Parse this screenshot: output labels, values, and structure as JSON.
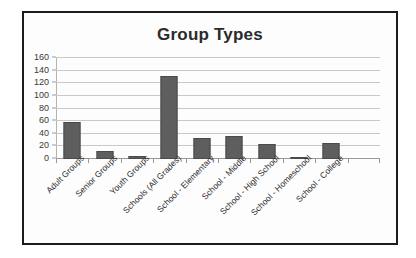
{
  "chart_data": {
    "type": "bar",
    "title": "Group Types",
    "xlabel": "",
    "ylabel": "",
    "ylim": [
      0,
      160
    ],
    "ytick_step": 20,
    "yticks": [
      "160",
      "140",
      "120",
      "100",
      "80",
      "60",
      "40",
      "20",
      "0"
    ],
    "grid": true,
    "legend": "none",
    "bar_color": "#5e5e5e",
    "gridline_color": "#c9c9c9",
    "border_color": "#1c1c1c",
    "categories": [
      "Adult Groups",
      "Senior Groups",
      "Youth Groups",
      "Schools (All Grades)",
      "School - Elementary",
      "School - Middle",
      "School - High School",
      "School - Homeschool",
      "School - College"
    ],
    "values": [
      59,
      13,
      4,
      132,
      33,
      37,
      23,
      2,
      25
    ]
  }
}
